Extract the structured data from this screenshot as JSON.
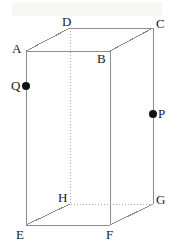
{
  "figure": {
    "stroke_color": "#8c8c8c",
    "dotted_color": "#a8a8a8",
    "label_color": "#1a1a1a",
    "point_color": "#111111",
    "background": "#ffffff",
    "stroke_width": 1,
    "vertices": [
      {
        "name": "A",
        "label": "A",
        "x": 26,
        "y": 51,
        "label_x": 12,
        "label_y": 42,
        "hidden": false
      },
      {
        "name": "B",
        "label": "B",
        "x": 110,
        "y": 51,
        "label_x": 97,
        "label_y": 52,
        "hidden": false
      },
      {
        "name": "C",
        "label": "C",
        "x": 153,
        "y": 28,
        "label_x": 156,
        "label_y": 17,
        "hidden": false
      },
      {
        "name": "D",
        "label": "D",
        "x": 70,
        "y": 28,
        "label_x": 62,
        "label_y": 15,
        "hidden": false
      },
      {
        "name": "E",
        "label": "E",
        "x": 26,
        "y": 225,
        "label_x": 16,
        "label_y": 228,
        "hidden": false
      },
      {
        "name": "F",
        "label": "F",
        "x": 110,
        "y": 225,
        "label_x": 106,
        "label_y": 228,
        "hidden": false
      },
      {
        "name": "G",
        "label": "G",
        "x": 153,
        "y": 204,
        "label_x": 156,
        "label_y": 193,
        "hidden": false
      },
      {
        "name": "H",
        "label": "H",
        "x": 70,
        "y": 204,
        "label_x": 58,
        "label_y": 191,
        "hidden": true
      }
    ],
    "edges": [
      {
        "name": "edge-AB",
        "from": "A",
        "to": "B",
        "style": "solid"
      },
      {
        "name": "edge-BC",
        "from": "B",
        "to": "C",
        "style": "solid"
      },
      {
        "name": "edge-CD",
        "from": "C",
        "to": "D",
        "style": "solid"
      },
      {
        "name": "edge-DA",
        "from": "D",
        "to": "A",
        "style": "solid"
      },
      {
        "name": "edge-EF",
        "from": "E",
        "to": "F",
        "style": "solid"
      },
      {
        "name": "edge-FG",
        "from": "F",
        "to": "G",
        "style": "solid"
      },
      {
        "name": "edge-GH",
        "from": "G",
        "to": "H",
        "style": "dotted"
      },
      {
        "name": "edge-HE",
        "from": "H",
        "to": "E",
        "style": "solid"
      },
      {
        "name": "edge-AE",
        "from": "A",
        "to": "E",
        "style": "solid"
      },
      {
        "name": "edge-BF",
        "from": "B",
        "to": "F",
        "style": "solid"
      },
      {
        "name": "edge-CG",
        "from": "C",
        "to": "G",
        "style": "solid"
      },
      {
        "name": "edge-DH",
        "from": "D",
        "to": "H",
        "style": "dotted"
      }
    ],
    "points": [
      {
        "name": "point-Q",
        "label": "Q",
        "x": 26,
        "y": 86,
        "radius": 4,
        "label_x": 11,
        "label_y": 79,
        "on_edge": "edge-AE"
      },
      {
        "name": "point-P",
        "label": "P",
        "x": 153,
        "y": 114,
        "radius": 4,
        "label_x": 158,
        "label_y": 107,
        "on_edge": "edge-CG"
      }
    ]
  }
}
